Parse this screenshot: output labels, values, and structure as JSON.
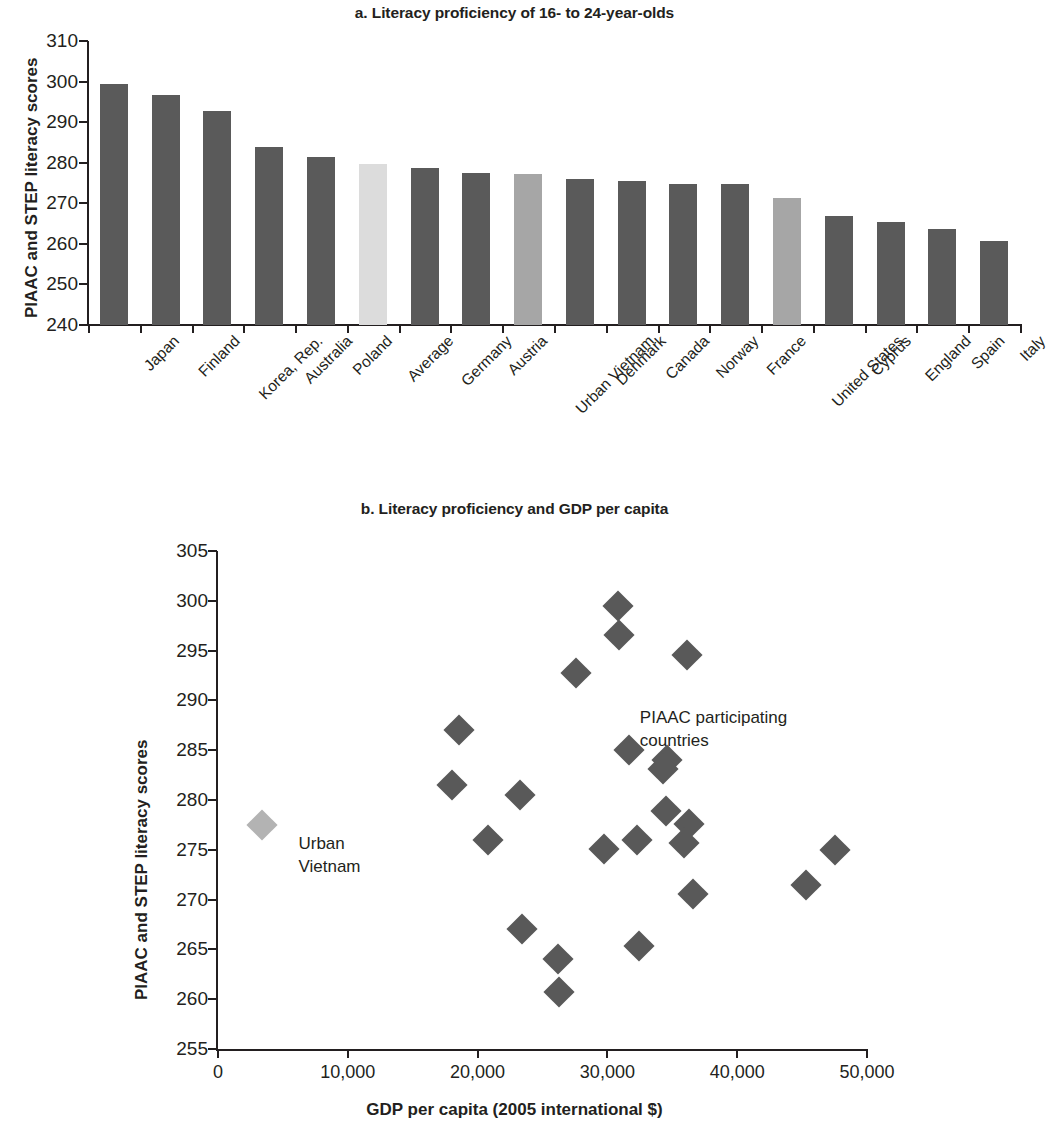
{
  "figure": {
    "panel_a_title": "a. Literacy proficiency of 16- to 24-year-olds",
    "panel_b_title": "b. Literacy proficiency and GDP per capita"
  },
  "colors": {
    "bar_default": "#5a5a5a",
    "bar_average": "#dcdcdc",
    "bar_highlight": "#a6a6a6",
    "point_default": "#595959",
    "point_highlight": "#b3b3b3",
    "axis": "#231f20"
  },
  "chart_data": [
    {
      "type": "bar",
      "title": "a. Literacy proficiency of 16- to 24-year-olds",
      "xlabel": "",
      "ylabel": "PIAAC and STEP literacy scores",
      "ylim": [
        240,
        310
      ],
      "yticks": [
        240,
        250,
        260,
        270,
        280,
        290,
        300,
        310
      ],
      "grid": false,
      "categories": [
        "Japan",
        "Finland",
        "Korea, Rep.",
        "Australia",
        "Poland",
        "Average",
        "Germany",
        "Austria",
        "Urban Vietnam",
        "Denmark",
        "Canada",
        "Norway",
        "France",
        "United States",
        "Cyprus",
        "England",
        "Spain",
        "Italy"
      ],
      "values": [
        299.5,
        296.6,
        292.8,
        284.0,
        281.4,
        279.8,
        278.8,
        277.5,
        277.3,
        275.9,
        275.6,
        274.8,
        274.7,
        271.4,
        266.8,
        265.3,
        263.7,
        260.6
      ],
      "bar_styles": [
        "default",
        "default",
        "default",
        "default",
        "default",
        "average",
        "default",
        "default",
        "highlight",
        "default",
        "default",
        "default",
        "default",
        "highlight",
        "default",
        "default",
        "default",
        "default"
      ]
    },
    {
      "type": "scatter",
      "title": "b. Literacy proficiency and GDP per capita",
      "xlabel": "GDP per capita (2005 international $)",
      "ylabel": "PIAAC and STEP literacy scores",
      "xlim": [
        0,
        50000
      ],
      "ylim": [
        255,
        305
      ],
      "xticks": [
        0,
        10000,
        20000,
        30000,
        40000,
        50000
      ],
      "xticklabels": [
        "0",
        "10,000",
        "20,000",
        "30,000",
        "40,000",
        "50,000"
      ],
      "yticks": [
        255,
        260,
        265,
        270,
        275,
        280,
        285,
        290,
        295,
        300,
        305
      ],
      "grid": false,
      "annotations": [
        {
          "text": "PIAAC participating\ncountries",
          "x": 32500,
          "y": 288.2
        },
        {
          "text": "Urban\nVietnam",
          "x": 6200,
          "y": 275.6
        }
      ],
      "series": [
        {
          "name": "PIAAC participating countries",
          "style": "default",
          "points": [
            {
              "x": 30800,
              "y": 299.5
            },
            {
              "x": 30900,
              "y": 296.6
            },
            {
              "x": 36100,
              "y": 294.6
            },
            {
              "x": 27600,
              "y": 292.8
            },
            {
              "x": 18600,
              "y": 287.0
            },
            {
              "x": 31700,
              "y": 285.0
            },
            {
              "x": 34600,
              "y": 284.0
            },
            {
              "x": 34300,
              "y": 283.1
            },
            {
              "x": 18000,
              "y": 281.5
            },
            {
              "x": 23300,
              "y": 280.5
            },
            {
              "x": 34500,
              "y": 278.9
            },
            {
              "x": 36300,
              "y": 277.6
            },
            {
              "x": 20800,
              "y": 276.0
            },
            {
              "x": 32300,
              "y": 276.0
            },
            {
              "x": 35900,
              "y": 275.7
            },
            {
              "x": 29700,
              "y": 275.1
            },
            {
              "x": 47500,
              "y": 275.0
            },
            {
              "x": 45300,
              "y": 271.5
            },
            {
              "x": 36600,
              "y": 270.6
            },
            {
              "x": 23400,
              "y": 267.0
            },
            {
              "x": 32400,
              "y": 265.3
            },
            {
              "x": 26200,
              "y": 264.0
            },
            {
              "x": 26300,
              "y": 260.7
            }
          ]
        },
        {
          "name": "Urban Vietnam",
          "style": "highlight",
          "points": [
            {
              "x": 3400,
              "y": 277.5
            }
          ]
        }
      ]
    }
  ]
}
